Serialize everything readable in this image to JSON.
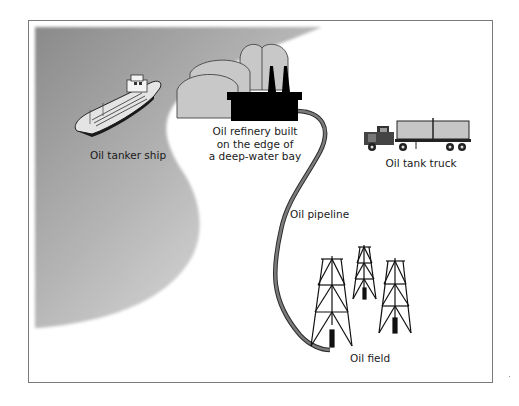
{
  "diagram": {
    "type": "illustration",
    "labels": {
      "tanker_ship": "Oil tanker ship",
      "refinery_line1": "Oil refinery built",
      "refinery_line2": "on the edge of",
      "refinery_line3": "a deep-water bay",
      "tank_truck": "Oil tank truck",
      "pipeline": "Oil pipeline",
      "oil_field": "Oil field"
    },
    "elements": [
      {
        "name": "bay-water",
        "shape": "gray gradient region"
      },
      {
        "name": "oil-tanker-ship",
        "icon": "ship-icon"
      },
      {
        "name": "oil-refinery",
        "icon": "refinery-icon"
      },
      {
        "name": "oil-tank-truck",
        "icon": "truck-icon"
      },
      {
        "name": "oil-pipeline",
        "icon": "pipeline-icon"
      },
      {
        "name": "oil-derricks",
        "icon": "derrick-icon",
        "count": 3
      }
    ],
    "colors": {
      "water_dark": "#8e8e8e",
      "water_light": "#e6e6e6",
      "tank_fill": "#c8c8c8",
      "pipeline": "#6e6e6e",
      "refinery": "#000000",
      "frame": "#7a7a7a"
    }
  }
}
